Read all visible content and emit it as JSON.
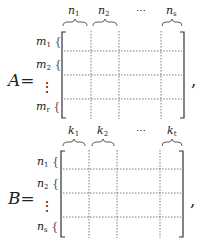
{
  "matrices": [
    {
      "name": "A",
      "equals": "=",
      "trailing": ",",
      "column_labels": [
        {
          "base": "n",
          "sub": "1"
        },
        {
          "base": "n",
          "sub": "2"
        },
        {
          "ellipsis": "⋯"
        },
        {
          "base": "n",
          "sub": "s"
        }
      ],
      "row_labels": [
        {
          "base": "m",
          "sub": "1"
        },
        {
          "base": "m",
          "sub": "2"
        },
        {
          "ellipsis": "⋮"
        },
        {
          "base": "m",
          "sub": "r"
        }
      ]
    },
    {
      "name": "B",
      "equals": "=",
      "trailing": ",",
      "column_labels": [
        {
          "base": "k",
          "sub": "1"
        },
        {
          "base": "k",
          "sub": "2"
        },
        {
          "ellipsis": "⋯"
        },
        {
          "base": "k",
          "sub": "t"
        }
      ],
      "row_labels": [
        {
          "base": "n",
          "sub": "1"
        },
        {
          "base": "n",
          "sub": "2"
        },
        {
          "ellipsis": "⋮"
        },
        {
          "base": "n",
          "sub": "s"
        }
      ]
    }
  ],
  "row_brace_glyph": "{",
  "colors": {
    "ink": "#222222",
    "dotted": "#555555",
    "background": "#ffffff"
  }
}
